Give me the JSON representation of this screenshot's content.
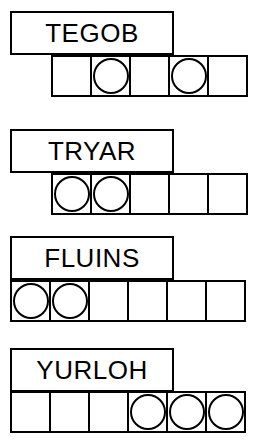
{
  "stimulus": {
    "type": "word-token-grid",
    "background_color": "#ffffff",
    "stroke_color": "#000000",
    "token_shape": "circle",
    "row_count": 4,
    "rows": [
      {
        "id": "row-1",
        "label": "TEGOB",
        "label_box": {
          "x": 10,
          "y": 11,
          "width": 164,
          "height": 44
        },
        "strip": {
          "x": 51,
          "y": 55,
          "cell_count": 5,
          "cell_width": 41,
          "cell_height": 42
        },
        "cells": [
          {
            "index": 1,
            "token": false
          },
          {
            "index": 2,
            "token": true
          },
          {
            "index": 3,
            "token": false
          },
          {
            "index": 4,
            "token": true
          },
          {
            "index": 5,
            "token": false
          }
        ],
        "token_count": 2,
        "token_positions": [
          2,
          4
        ]
      },
      {
        "id": "row-2",
        "label": "TRYAR",
        "label_box": {
          "x": 10,
          "y": 129,
          "width": 164,
          "height": 44
        },
        "strip": {
          "x": 51,
          "y": 173,
          "cell_count": 5,
          "cell_width": 41,
          "cell_height": 42
        },
        "cells": [
          {
            "index": 1,
            "token": true
          },
          {
            "index": 2,
            "token": true
          },
          {
            "index": 3,
            "token": false
          },
          {
            "index": 4,
            "token": false
          },
          {
            "index": 5,
            "token": false
          }
        ],
        "token_count": 2,
        "token_positions": [
          1,
          2
        ]
      },
      {
        "id": "row-3",
        "label": "FLUINS",
        "label_box": {
          "x": 10,
          "y": 236,
          "width": 164,
          "height": 44
        },
        "strip": {
          "x": 10,
          "y": 280,
          "cell_count": 6,
          "cell_width": 41,
          "cell_height": 42
        },
        "cells": [
          {
            "index": 1,
            "token": true
          },
          {
            "index": 2,
            "token": true
          },
          {
            "index": 3,
            "token": false
          },
          {
            "index": 4,
            "token": false
          },
          {
            "index": 5,
            "token": false
          },
          {
            "index": 6,
            "token": false
          }
        ],
        "token_count": 2,
        "token_positions": [
          1,
          2
        ]
      },
      {
        "id": "row-4",
        "label": "YURLOH",
        "label_box": {
          "x": 10,
          "y": 348,
          "width": 164,
          "height": 44
        },
        "strip": {
          "x": 10,
          "y": 391,
          "cell_count": 6,
          "cell_width": 41,
          "cell_height": 42
        },
        "cells": [
          {
            "index": 1,
            "token": false
          },
          {
            "index": 2,
            "token": false
          },
          {
            "index": 3,
            "token": false
          },
          {
            "index": 4,
            "token": true
          },
          {
            "index": 5,
            "token": true
          },
          {
            "index": 6,
            "token": true
          }
        ],
        "token_count": 3,
        "token_positions": [
          4,
          5,
          6
        ]
      }
    ]
  }
}
